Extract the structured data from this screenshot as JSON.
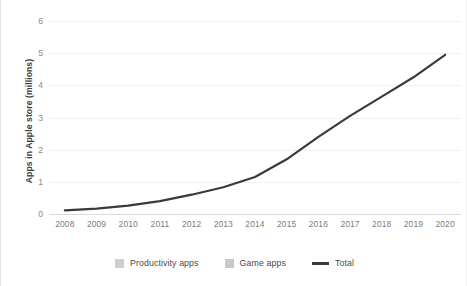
{
  "chart_data": {
    "type": "bar",
    "stacked": true,
    "title": "",
    "xlabel": "",
    "ylabel": "Apps in Apple store (millions)",
    "categories": [
      "2008",
      "2009",
      "2010",
      "2011",
      "2012",
      "2013",
      "2014",
      "2015",
      "2016",
      "2017",
      "2018",
      "2019",
      "2020"
    ],
    "ylim": [
      0,
      6
    ],
    "yticks": [
      0,
      1,
      2,
      3,
      4,
      5,
      6
    ],
    "ytick_labels": [
      "0",
      "1",
      "2",
      "3",
      "4",
      "5",
      "6"
    ],
    "grid": "horizontal",
    "legend_position": "bottom",
    "series": [
      {
        "name": "Productivity apps",
        "type": "bar",
        "color": "#cdcdcd",
        "values": [
          0.06,
          0.09,
          0.14,
          0.21,
          0.31,
          0.43,
          0.58,
          0.85,
          1.2,
          1.55,
          1.85,
          2.15,
          2.5
        ]
      },
      {
        "name": "Game apps",
        "type": "bar",
        "color": "#c9c9c9",
        "values": [
          0.05,
          0.08,
          0.12,
          0.19,
          0.29,
          0.4,
          0.57,
          0.85,
          1.2,
          1.5,
          1.8,
          2.1,
          2.45
        ]
      },
      {
        "name": "Total",
        "type": "line",
        "color": "#3a3a3a",
        "values": [
          0.11,
          0.17,
          0.26,
          0.4,
          0.6,
          0.83,
          1.15,
          1.7,
          2.4,
          3.05,
          3.65,
          4.25,
          4.95
        ]
      }
    ]
  },
  "axis": {
    "y_title": "Apps in Apple store (millions)"
  },
  "legend": {
    "items": [
      {
        "label": "Productivity apps",
        "marker": "square-swatch-icon",
        "color": "#cdcdcd"
      },
      {
        "label": "Game apps",
        "marker": "square-swatch-icon",
        "color": "#c9c9c9"
      },
      {
        "label": "Total",
        "marker": "line-swatch-icon",
        "color": "#3a3a3a"
      }
    ]
  }
}
